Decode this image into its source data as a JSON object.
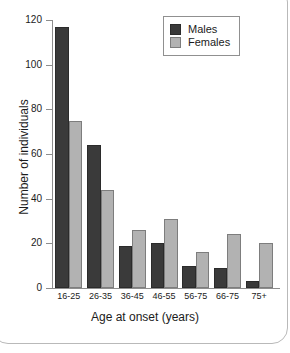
{
  "chart_data": {
    "type": "bar",
    "title": "",
    "subtitle": "",
    "xlabel": "Age at onset (years)",
    "ylabel": "Number of individuals",
    "categories": [
      "16-25",
      "26-35",
      "36-45",
      "46-55",
      "56-75",
      "66-75",
      "75+"
    ],
    "series": [
      {
        "name": "Males",
        "color": "#3a3a3a",
        "values": [
          117,
          64,
          19,
          20,
          10,
          9,
          3
        ]
      },
      {
        "name": "Females",
        "color": "#b2b2b2",
        "values": [
          75,
          44,
          26,
          31,
          16,
          24,
          20
        ]
      }
    ],
    "ylim": [
      0,
      120
    ],
    "yticks": [
      0,
      20,
      40,
      60,
      80,
      100,
      120
    ],
    "ytick_labels": [
      "0",
      "20",
      "40",
      "60",
      "80",
      "100",
      "120"
    ],
    "grid": false,
    "legend_position": "top-right",
    "legend_entries": [
      "Males",
      "Females"
    ]
  },
  "legend": {
    "males_label": "Males",
    "females_label": "Females"
  },
  "axes": {
    "x_title": "Age at onset (years)",
    "y_title": "Number of individuals"
  }
}
